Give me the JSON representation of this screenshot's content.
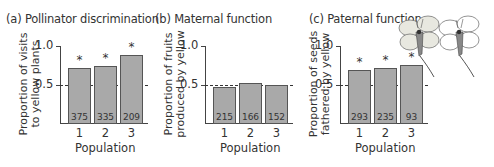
{
  "chart_data": [
    {
      "type": "bar",
      "title": "(a) Pollinator discrimination",
      "xlabel": "Population",
      "ylabel": "Proportion of visits to yellow plants",
      "ylabel_lines": [
        "Proportion of visits",
        "to yellow plants"
      ],
      "categories": [
        "1",
        "2",
        "3"
      ],
      "values": [
        0.71,
        0.74,
        0.88
      ],
      "sample_sizes": [
        "375",
        "335",
        "209"
      ],
      "significant": [
        true,
        true,
        true
      ],
      "ylim": [
        0,
        1.0
      ],
      "yticks": [
        "0.5",
        "1.0"
      ],
      "reference_line": 0.5
    },
    {
      "type": "bar",
      "title": "(b) Maternal function",
      "xlabel": "Population",
      "ylabel": "Proportion of fruits produced by yellow",
      "ylabel_lines": [
        "Proportion of fruits",
        "produced by yellow"
      ],
      "categories": [
        "1",
        "2",
        "3"
      ],
      "values": [
        0.47,
        0.52,
        0.49
      ],
      "sample_sizes": [
        "215",
        "166",
        "152"
      ],
      "significant": [
        false,
        false,
        false
      ],
      "ylim": [
        0,
        1.0
      ],
      "yticks": [
        "0.5",
        "1.0"
      ],
      "reference_line": 0.5
    },
    {
      "type": "bar",
      "title": "(c) Paternal function",
      "xlabel": "Population",
      "ylabel": "Proportion of seeds fathered by yellow",
      "ylabel_lines": [
        "Proportion of seeds",
        "fathered by yellow"
      ],
      "categories": [
        "1",
        "2",
        "3"
      ],
      "values": [
        0.69,
        0.72,
        0.75
      ],
      "sample_sizes": [
        "293",
        "235",
        "93"
      ],
      "significant": [
        true,
        true,
        true
      ],
      "ylim": [
        0,
        1.0
      ],
      "yticks": [
        "0.5",
        "1.0"
      ],
      "reference_line": 0.5
    }
  ],
  "annotations": {
    "star": "*",
    "flower_icons": [
      "yellow-flower-icon",
      "white-flower-icon"
    ]
  },
  "colors": {
    "bar_fill": "#a9a9a9",
    "bar_edge": "#555555",
    "axis": "#444444",
    "flower_yellow_petal": "#e8e8e0",
    "flower_white_petal": "#ffffff"
  }
}
